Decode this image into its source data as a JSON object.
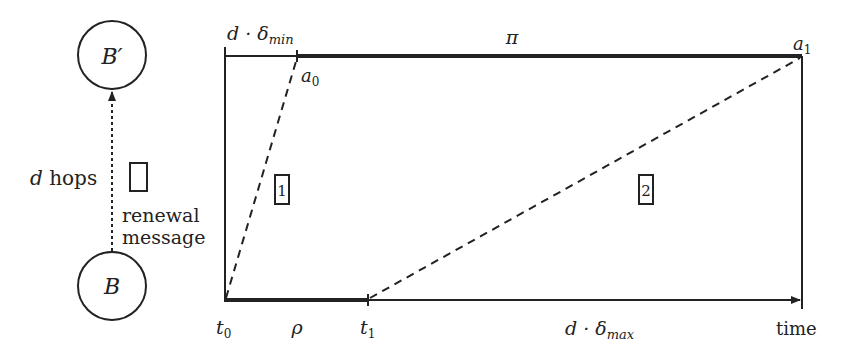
{
  "nodes": {
    "top": {
      "label": "B′"
    },
    "bottom": {
      "label": "B"
    }
  },
  "edge": {
    "hops_var": "d",
    "hops_text": " hops",
    "message_line1": "renewal",
    "message_line2": "message"
  },
  "timeline": {
    "top_left_label": {
      "var": "d · δ",
      "sub": "min"
    },
    "top_mid_label": "π",
    "a0": {
      "var": "a",
      "sub": "0"
    },
    "a1": {
      "var": "a",
      "sub": "1"
    },
    "t0": {
      "var": "t",
      "sub": "0"
    },
    "t1": {
      "var": "t",
      "sub": "1"
    },
    "rho": "ρ",
    "bottom_mid_label": {
      "var": "d · δ",
      "sub": "max"
    },
    "axis_label": "time",
    "box1": "1",
    "box2": "2"
  }
}
